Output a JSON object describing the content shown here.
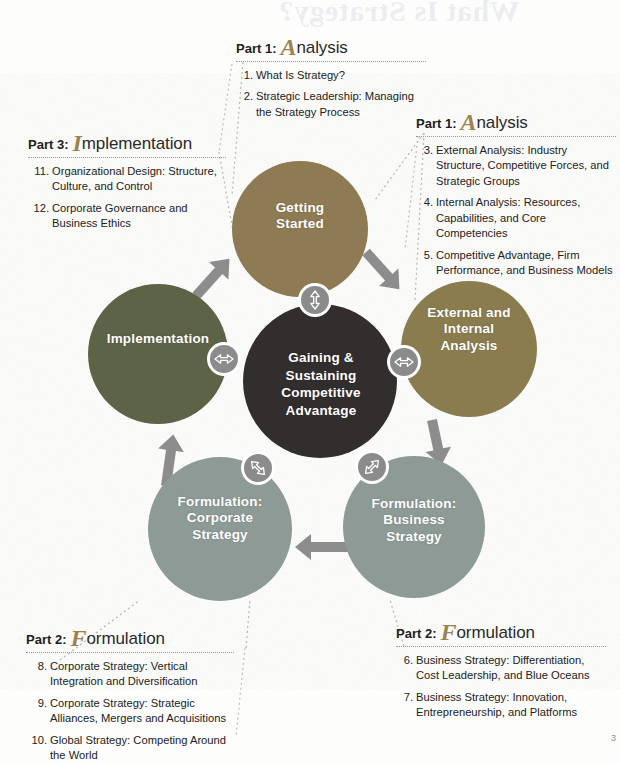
{
  "page": {
    "watermark_text": "What Is Strategy?",
    "watermark_text2": "Part 1:",
    "page_number": "3"
  },
  "center": {
    "label": "Gaining &\nSustaining\nCompetitive\nAdvantage",
    "color": "#332f2d"
  },
  "nodes": [
    {
      "id": "getting-started",
      "label": "Getting\nStarted",
      "color": "#8e7a52"
    },
    {
      "id": "external-internal-analysis",
      "label": "External and\nInternal\nAnalysis",
      "color": "#8a7c4f"
    },
    {
      "id": "formulation-business-strategy",
      "label": "Formulation:\nBusiness\nStrategy",
      "color": "#8d9a96"
    },
    {
      "id": "formulation-corporate-strategy",
      "label": "Formulation:\nCorporate\nStrategy",
      "color": "#8d9a96"
    },
    {
      "id": "implementation",
      "label": "Implementation",
      "color": "#5d6346"
    }
  ],
  "connectors": [
    {
      "id": "center-to-getting-started",
      "icon": "double-arrow-vertical"
    },
    {
      "id": "center-to-external-internal",
      "icon": "double-arrow-horizontal"
    },
    {
      "id": "center-to-implementation",
      "icon": "double-arrow-horizontal"
    },
    {
      "id": "center-to-business-strategy",
      "icon": "double-arrow-diagonal-nwse"
    },
    {
      "id": "center-to-corporate-strategy",
      "icon": "double-arrow-diagonal-nesw"
    }
  ],
  "flow_arrows": [
    {
      "id": "implementation-to-getting-started",
      "icon": "arrow-up-right"
    },
    {
      "id": "getting-started-to-external",
      "icon": "arrow-down-right"
    },
    {
      "id": "external-to-business-strategy",
      "icon": "arrow-down"
    },
    {
      "id": "business-to-corporate-strategy",
      "icon": "arrow-left"
    },
    {
      "id": "corporate-to-implementation",
      "icon": "arrow-up"
    }
  ],
  "parts": {
    "top": {
      "pre": "Part 1:",
      "dropcap": "A",
      "rest": "nalysis",
      "items": [
        {
          "num": "1.",
          "text": "What Is Strategy?"
        },
        {
          "num": "2.",
          "text": "Strategic Leadership: Managing the Strategy Process"
        }
      ]
    },
    "right": {
      "pre": "Part 1:",
      "dropcap": "A",
      "rest": "nalysis",
      "items": [
        {
          "num": "3.",
          "text": "External Analysis: Industry Structure, Competitive Forces, and Strategic Groups"
        },
        {
          "num": "4.",
          "text": "Internal Analysis: Resources, Capabilities, and Core Competencies"
        },
        {
          "num": "5.",
          "text": "Competitive Advantage, Firm Performance, and Business Models"
        }
      ]
    },
    "left": {
      "pre": "Part 3:",
      "dropcap": "I",
      "rest": "mplementation",
      "items": [
        {
          "num": "11.",
          "text": "Organizational Design: Structure, Culture, and Control"
        },
        {
          "num": "12.",
          "text": "Corporate Governance and Business Ethics"
        }
      ]
    },
    "bottom_left": {
      "pre": "Part 2:",
      "dropcap": "F",
      "rest": "ormulation",
      "items": [
        {
          "num": "8.",
          "text": "Corporate Strategy: Vertical Integration and Diversification"
        },
        {
          "num": "9.",
          "text": "Corporate Strategy: Strategic Alliances, Mergers and Acquisitions"
        },
        {
          "num": "10.",
          "text": "Global Strategy: Competing Around the World"
        }
      ]
    },
    "bottom_right": {
      "pre": "Part 2:",
      "dropcap": "F",
      "rest": "ormulation",
      "items": [
        {
          "num": "6.",
          "text": "Business Strategy: Differentiation, Cost Leadership, and Blue Oceans"
        },
        {
          "num": "7.",
          "text": "Business Strategy: Innovation, Entrepreneurship, and Platforms"
        }
      ]
    }
  }
}
